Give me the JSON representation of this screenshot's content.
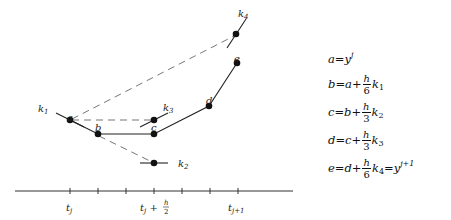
{
  "diagram": {
    "points": {
      "a": {
        "label": "a",
        "x": 70,
        "y": 120
      },
      "b": {
        "label": "b",
        "x": 98,
        "y": 134
      },
      "c": {
        "label": "c",
        "x": 154,
        "y": 134
      },
      "d": {
        "label": "d",
        "x": 209,
        "y": 106
      },
      "e": {
        "label": "e",
        "x": 237,
        "y": 63
      },
      "k2pt": {
        "x": 154,
        "y": 163
      },
      "k3pt": {
        "x": 154,
        "y": 120
      },
      "k4pt": {
        "x": 236,
        "y": 34
      }
    },
    "slope_labels": {
      "k1": "k",
      "k1_sub": "1",
      "k2": "k",
      "k2_sub": "2",
      "k3": "k",
      "k3_sub": "3",
      "k4": "k",
      "k4_sub": "4"
    },
    "axis": {
      "tick_labels": {
        "tj": "t",
        "tj_sub": "j",
        "tmid": "t",
        "tmid_sub": "j",
        "tmid_plus": " + ",
        "tmid_num": "h",
        "tmid_den": "2",
        "tj1": "t",
        "tj1_sub": "j+1"
      }
    }
  },
  "equations": [
    {
      "lhs": "a",
      "rhs_var": "y",
      "rhs_sup": "j"
    },
    {
      "lhs": "b",
      "prev": "a",
      "num": "h",
      "den": "6",
      "k": "k",
      "k_sub": "1"
    },
    {
      "lhs": "c",
      "prev": "b",
      "num": "h",
      "den": "3",
      "k": "k",
      "k_sub": "2"
    },
    {
      "lhs": "d",
      "prev": "c",
      "num": "h",
      "den": "3",
      "k": "k",
      "k_sub": "3"
    },
    {
      "lhs": "e",
      "prev": "d",
      "num": "h",
      "den": "6",
      "k": "k",
      "k_sub": "4",
      "tail_var": "y",
      "tail_sup": "j+1"
    }
  ],
  "symbols": {
    "eq": " = ",
    "plus": " + "
  }
}
